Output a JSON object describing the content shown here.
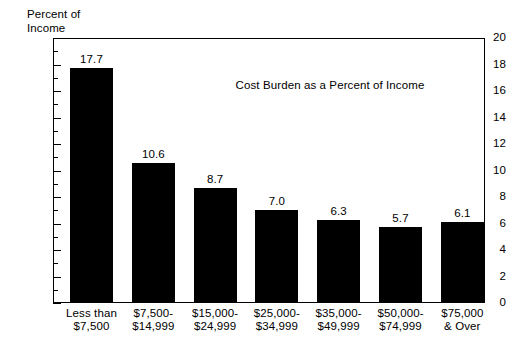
{
  "chart_data": {
    "type": "bar",
    "title": "",
    "annotation": "Cost Burden as a Percent of Income",
    "ylabel": "Percent of\nIncome",
    "xlabel": "",
    "ylim": [
      0,
      20
    ],
    "ytick_step": 2,
    "yminor_step": 1,
    "grid": false,
    "legend": null,
    "bar_color": "#000000",
    "background_color": "#ffffff",
    "categories": [
      "Less than\n$7,500",
      "$7,500-\n$14,999",
      "$15,000-\n$24,999",
      "$25,000-\n$34,999",
      "$35,000-\n$49,999",
      "$50,000-\n$74,999",
      "$75,000\n& Over"
    ],
    "values": [
      17.7,
      10.6,
      8.7,
      7.0,
      6.3,
      5.7,
      6.1
    ],
    "value_labels": [
      "17.7",
      "10.6",
      "8.7",
      "7.0",
      "6.3",
      "5.7",
      "6.1"
    ],
    "ytick_labels": [
      "20",
      "18",
      "16",
      "14",
      "12",
      "10",
      "8",
      "6",
      "4",
      "2",
      "0"
    ],
    "ytick_values": [
      20,
      18,
      16,
      14,
      12,
      10,
      8,
      6,
      4,
      2,
      0
    ]
  }
}
